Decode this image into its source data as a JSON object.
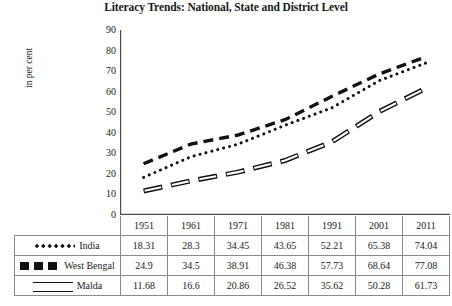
{
  "chart_data": {
    "type": "line",
    "title": "Literacy Trends: National, State and District Level",
    "xlabel": "",
    "ylabel": "in per cent",
    "categories": [
      "1951",
      "1961",
      "1971",
      "1981",
      "1991",
      "2001",
      "2011"
    ],
    "ylim": [
      0,
      90
    ],
    "yticks": [
      0,
      10,
      20,
      30,
      40,
      50,
      60,
      70,
      80,
      90
    ],
    "grid": false,
    "legend_position": "table-first-column",
    "series": [
      {
        "name": "India",
        "style": "dotted",
        "color": "#111111",
        "values": [
          18.31,
          28.3,
          34.45,
          43.65,
          52.21,
          65.38,
          74.04
        ]
      },
      {
        "name": "West Bengal",
        "style": "dashed",
        "color": "#111111",
        "values": [
          24.9,
          34.5,
          38.91,
          46.38,
          57.73,
          68.64,
          77.08
        ]
      },
      {
        "name": "Malda",
        "style": "double-line",
        "color": "#111111",
        "values": [
          11.68,
          16.6,
          20.86,
          26.52,
          35.62,
          50.28,
          61.73
        ]
      }
    ]
  },
  "table": {
    "corner_header": "",
    "column_headers": [
      "1951",
      "1961",
      "1971",
      "1981",
      "1991",
      "2001",
      "2011"
    ],
    "rows": [
      {
        "label": "India",
        "marker": "dotted-line-icon",
        "cells": [
          "18.31",
          "28.3",
          "34.45",
          "43.65",
          "52.21",
          "65.38",
          "74.04"
        ]
      },
      {
        "label": "West Bengal",
        "marker": "dashed-line-icon",
        "cells": [
          "24.9",
          "34.5",
          "38.91",
          "46.38",
          "57.73",
          "68.64",
          "77.08"
        ]
      },
      {
        "label": "Malda",
        "marker": "double-line-icon",
        "cells": [
          "11.68",
          "16.6",
          "20.86",
          "26.52",
          "35.62",
          "50.28",
          "61.73"
        ]
      }
    ]
  }
}
